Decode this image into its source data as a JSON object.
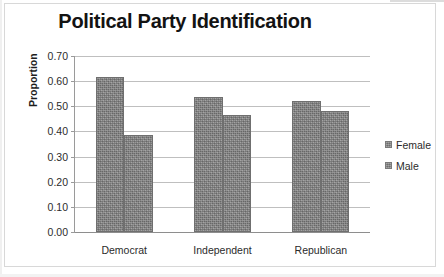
{
  "chart_data": {
    "type": "bar",
    "title": "Political Party Identification",
    "xlabel": "",
    "ylabel": "Proportion",
    "categories": [
      "Democrat",
      "Independent",
      "Republican"
    ],
    "series": [
      {
        "name": "Female",
        "values": [
          0.615,
          0.537,
          0.523
        ],
        "color": "#888888"
      },
      {
        "name": "Male",
        "values": [
          0.385,
          0.465,
          0.48
        ],
        "color": "#888888"
      }
    ],
    "ylim": [
      0.0,
      0.7
    ],
    "ytick_step": 0.1,
    "ytick_labels": [
      "0.70",
      "0.60",
      "0.50",
      "0.40",
      "0.30",
      "0.20",
      "0.10",
      "0.00"
    ],
    "ytick_values": [
      0.7,
      0.6,
      0.5,
      0.4,
      0.3,
      0.2,
      0.1,
      0.0
    ],
    "grid": true,
    "legend_position": "right",
    "legend_entries": [
      "Female",
      "Male"
    ]
  },
  "legend": {
    "female_label": "Female",
    "male_label": "Male"
  }
}
